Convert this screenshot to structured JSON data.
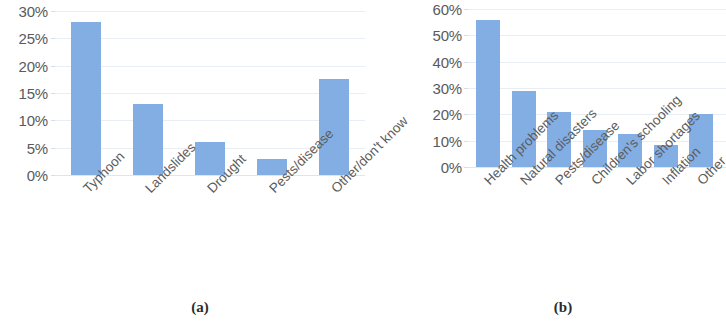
{
  "figure": {
    "background": "#ffffff",
    "bar_color": "#83aee3",
    "gridline_color": "#e9eef4",
    "text_color": "#5a5a5a"
  },
  "panels": [
    {
      "caption": "(a)",
      "chart_data": {
        "type": "bar",
        "title": "",
        "xlabel": "",
        "ylabel": "",
        "categories": [
          "Typhoon",
          "Landslides",
          "Drought",
          "Pests/disease",
          "Other/don't know"
        ],
        "values": [
          28,
          13,
          6,
          3,
          17.5
        ],
        "ylim": [
          0,
          30
        ],
        "yticks": [
          0,
          5,
          10,
          15,
          20,
          25,
          30
        ],
        "ytick_labels": [
          "0%",
          "5%",
          "10%",
          "15%",
          "20%",
          "25%",
          "30%"
        ],
        "grid": true,
        "legend": "none",
        "series": [
          {
            "name": "Share of respondents",
            "values": [
              28,
              13,
              6,
              3,
              17.5
            ]
          }
        ]
      }
    },
    {
      "caption": "(b)",
      "chart_data": {
        "type": "bar",
        "title": "",
        "xlabel": "",
        "ylabel": "",
        "categories": [
          "Health problems",
          "Natural disasters",
          "Pests/disease",
          "Children's schooling",
          "Labor shortages",
          "Inflation",
          "Other"
        ],
        "values": [
          56,
          29,
          21,
          14,
          12.5,
          8.5,
          20
        ],
        "ylim": [
          0,
          60
        ],
        "yticks": [
          0,
          10,
          20,
          30,
          40,
          50,
          60
        ],
        "ytick_labels": [
          "0%",
          "10%",
          "20%",
          "30%",
          "40%",
          "50%",
          "60%"
        ],
        "grid": true,
        "legend": "none",
        "series": [
          {
            "name": "Share of respondents",
            "values": [
              56,
              29,
              21,
              14,
              12.5,
              8.5,
              20
            ]
          }
        ]
      }
    }
  ]
}
